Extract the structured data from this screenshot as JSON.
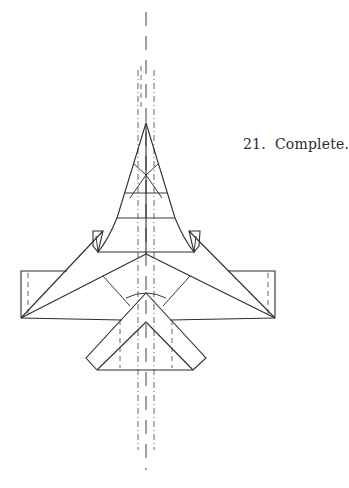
{
  "step": {
    "number": "21.",
    "label": "Complete."
  },
  "diagram": {
    "line_types": [
      "solid-edge",
      "valley-fold-dashed",
      "mountain-fold-dash-dot",
      "center-axis"
    ]
  }
}
